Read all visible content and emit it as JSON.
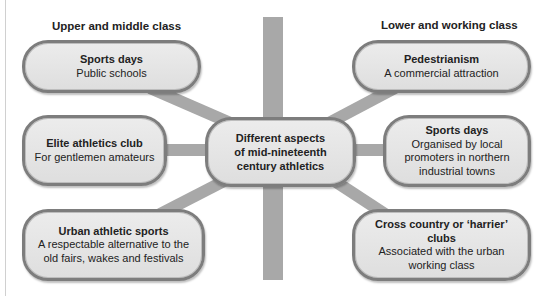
{
  "diagram": {
    "central_node": {
      "label": "Different aspects\nof mid-nineteenth\ncentury athletics"
    },
    "left_group": {
      "heading": "Upper and middle class",
      "nodes": [
        {
          "title": "Sports days",
          "subtitle": "Public schools"
        },
        {
          "title": "Elite athletics club",
          "subtitle": "For gentlemen amateurs"
        },
        {
          "title": "Urban athletic sports",
          "subtitle": "A respectable alternative to the\nold fairs, wakes and festivals"
        }
      ]
    },
    "right_group": {
      "heading": "Lower and working class",
      "nodes": [
        {
          "title": "Pedestrianism",
          "subtitle": "A commercial attraction"
        },
        {
          "title": "Sports days",
          "subtitle": "Organised by local\npromoters in northern\nindustrial towns"
        },
        {
          "title": "Cross country or ‘harrier’ clubs",
          "subtitle": "Associated with the urban\nworking class"
        }
      ]
    },
    "colors": {
      "node_fill": "#e4e4e4",
      "node_border": "#7d7d7d",
      "connector": "#a8a8a8",
      "divider_bar": "#a8a8a8",
      "text": "#222222"
    }
  }
}
